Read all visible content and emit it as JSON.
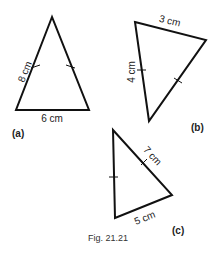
{
  "figure": {
    "caption": "Fig. 21.21",
    "stroke_color": "#111111"
  },
  "triangles": [
    {
      "id": "a",
      "tag": "(a)",
      "labels": {
        "left_side": "8 cm",
        "base": "6 cm"
      },
      "equal_side_ticks": "left and right sides marked equal"
    },
    {
      "id": "b",
      "tag": "(b)",
      "labels": {
        "top_side": "3 cm",
        "left_side": "4 cm"
      },
      "equal_side_ticks": "left and right sides marked equal"
    },
    {
      "id": "c",
      "tag": "(c)",
      "labels": {
        "hypotenuse_side": "7 cm",
        "base_side": "5 cm"
      },
      "equal_side_ticks": "left and slanted right sides marked equal"
    }
  ]
}
